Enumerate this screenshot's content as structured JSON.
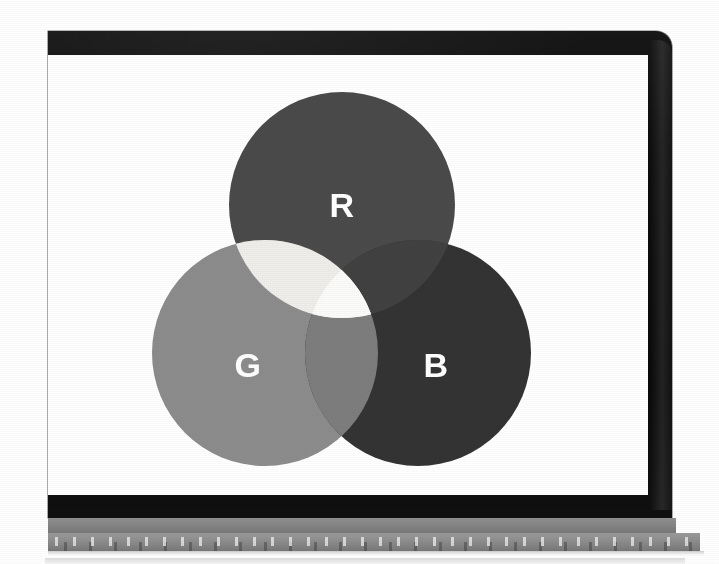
{
  "scene": {
    "description": "Photograph of a laptop screen displaying an additive RGB Venn diagram",
    "background_color": "#ffffff"
  },
  "laptop": {
    "bezel_color": "#0d0d0d",
    "screen_background": "#ffffff",
    "hinge_color": "#868686",
    "deck_color": "#8d8d8d",
    "deck_edge_color": "#f2f2f2"
  },
  "chart_data": {
    "type": "venn",
    "set_count": 3,
    "radius": 113,
    "labels": [
      "R",
      "G",
      "B"
    ],
    "sets": [
      {
        "id": "R",
        "label": "R",
        "name": "Red",
        "color": "#4a4a4a",
        "cx": 294,
        "cy": 150,
        "r": 113,
        "label_x": 294,
        "label_y": 150
      },
      {
        "id": "G",
        "label": "G",
        "name": "Green",
        "color": "#8c8c8c",
        "cx": 217,
        "cy": 298,
        "r": 113,
        "label_x": 200,
        "label_y": 310
      },
      {
        "id": "B",
        "label": "B",
        "name": "Blue",
        "color": "#333333",
        "cx": 370,
        "cy": 298,
        "r": 113,
        "label_x": 388,
        "label_y": 310
      }
    ],
    "intersections": [
      {
        "id": "RG",
        "sets": [
          "R",
          "G"
        ],
        "name": "Yellow",
        "color": "#efeeea"
      },
      {
        "id": "RB",
        "sets": [
          "R",
          "B"
        ],
        "name": "Magenta",
        "color": "#414141"
      },
      {
        "id": "GB",
        "sets": [
          "G",
          "B"
        ],
        "name": "Cyan",
        "color": "#7d7d7d"
      },
      {
        "id": "RGB",
        "sets": [
          "R",
          "G",
          "B"
        ],
        "name": "White",
        "color": "#fbfbfa"
      }
    ],
    "label_color": "#ffffff",
    "label_font_size": 34,
    "canvas": {
      "width": 600,
      "height": 440
    }
  }
}
